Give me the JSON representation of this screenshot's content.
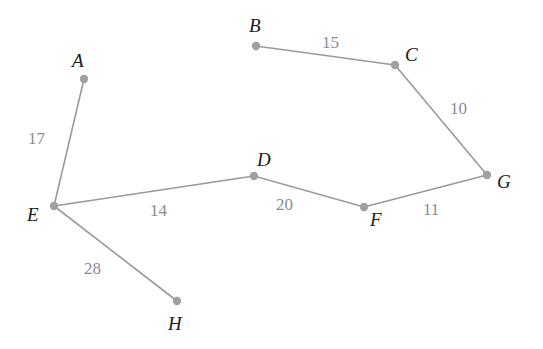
{
  "graph": {
    "type": "weighted-undirected-graph",
    "nodes": [
      {
        "id": "A",
        "x": 84,
        "y": 79,
        "lx": 72,
        "ly": 67
      },
      {
        "id": "B",
        "x": 256,
        "y": 46,
        "lx": 249,
        "ly": 32
      },
      {
        "id": "C",
        "x": 395,
        "y": 65,
        "lx": 405,
        "ly": 61
      },
      {
        "id": "D",
        "x": 254,
        "y": 176,
        "lx": 257,
        "ly": 166
      },
      {
        "id": "E",
        "x": 54,
        "y": 206,
        "lx": 27,
        "ly": 221
      },
      {
        "id": "F",
        "x": 364,
        "y": 207,
        "lx": 370,
        "ly": 226
      },
      {
        "id": "G",
        "x": 487,
        "y": 175,
        "lx": 497,
        "ly": 188
      },
      {
        "id": "H",
        "x": 177,
        "y": 301,
        "lx": 168,
        "ly": 330
      }
    ],
    "edges": [
      {
        "from": "A",
        "to": "E",
        "weight": "17",
        "lx": 28,
        "ly": 144
      },
      {
        "from": "B",
        "to": "C",
        "weight": "15",
        "lx": 322,
        "ly": 48
      },
      {
        "from": "C",
        "to": "G",
        "weight": "10",
        "lx": 450,
        "ly": 114
      },
      {
        "from": "E",
        "to": "D",
        "weight": "14",
        "lx": 150,
        "ly": 216
      },
      {
        "from": "D",
        "to": "F",
        "weight": "20",
        "lx": 276,
        "ly": 210
      },
      {
        "from": "F",
        "to": "G",
        "weight": "11",
        "lx": 423,
        "ly": 215
      },
      {
        "from": "E",
        "to": "H",
        "weight": "28",
        "lx": 84,
        "ly": 274
      }
    ],
    "colors": {
      "edge": "#9a9a9a",
      "node": "#a0a0a0",
      "node_label": "#1a1a1a",
      "weight_label": "#8c8c8c"
    }
  }
}
